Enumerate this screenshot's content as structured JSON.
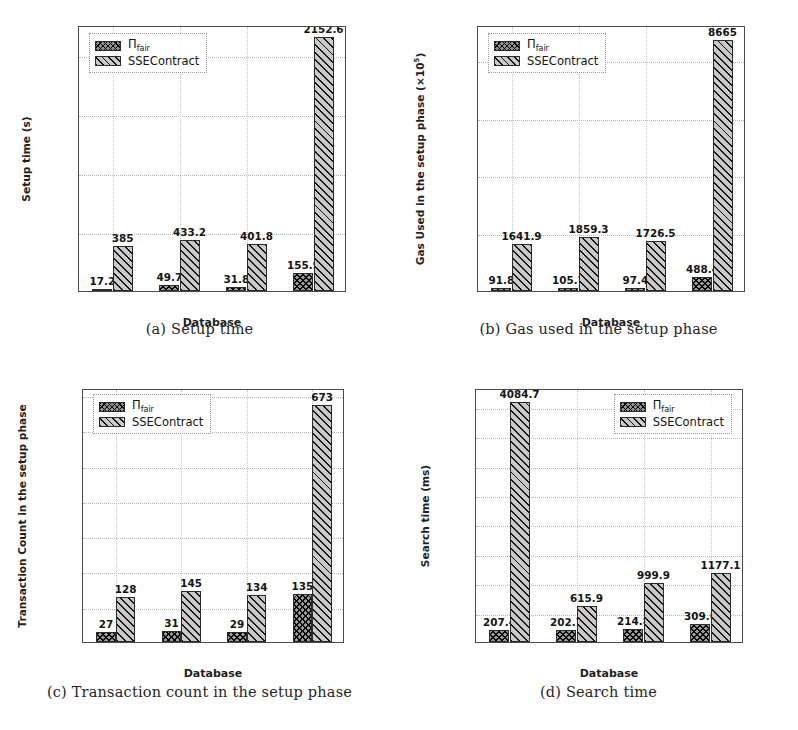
{
  "figure": {
    "series_labels": {
      "a": "Π",
      "a_sub": "fair",
      "b": "SSEContract"
    },
    "categories": [
      "DB",
      "DB",
      "DB",
      "DB"
    ],
    "category_subs": [
      "1",
      "2",
      "3",
      "4"
    ],
    "xlabel": "Database"
  },
  "panels": {
    "a": {
      "caption": "(a) Setup time",
      "ylabel": "Setup time (s)",
      "yticks": [
        "0",
        "500",
        "1000",
        "1500",
        "2000"
      ],
      "labels_a": [
        "17.2",
        "49.7",
        "31.8",
        "155.9"
      ],
      "labels_b": [
        "385",
        "433.2",
        "401.8",
        "2152.6"
      ]
    },
    "b": {
      "caption": "(b) Gas used in the setup phase",
      "ylabel": "Gas Used in the setup phase (×10",
      "ylabel_sup": "5",
      "ylabel_tail": ")",
      "yticks": [
        "0",
        "2000",
        "4000",
        "6000",
        "8000"
      ],
      "labels_a": [
        "91.8",
        "105.7",
        "97.4",
        "488.4"
      ],
      "labels_b": [
        "1641.9",
        "1859.3",
        "1726.5",
        "8665"
      ]
    },
    "c": {
      "caption": "(c) Transaction count in the setup phase",
      "ylabel": "Transaction Count in the setup phase",
      "yticks": [
        "0",
        "100",
        "200",
        "300",
        "400",
        "500",
        "600",
        "700"
      ],
      "labels_a": [
        "27",
        "31",
        "29",
        "135"
      ],
      "labels_b": [
        "128",
        "145",
        "134",
        "673"
      ]
    },
    "d": {
      "caption": "(d) Search time",
      "ylabel": "Search time (ms)",
      "yticks": [
        "0",
        "500",
        "1000",
        "1500",
        "2000",
        "2500",
        "3000",
        "3500",
        "4000"
      ],
      "labels_a": [
        "207.4",
        "202.7",
        "214.8",
        "309.6"
      ],
      "labels_b": [
        "4084.7",
        "615.9",
        "999.9",
        "1177.1"
      ]
    }
  },
  "chart_data": [
    {
      "id": "a",
      "type": "bar",
      "title": "(a) Setup time",
      "xlabel": "Database",
      "ylabel": "Setup time (s)",
      "categories": [
        "DB1",
        "DB2",
        "DB3",
        "DB4"
      ],
      "series": [
        {
          "name": "Π_fair",
          "values": [
            17.2,
            49.7,
            31.8,
            155.9
          ]
        },
        {
          "name": "SSEContract",
          "values": [
            385,
            433.2,
            401.8,
            2152.6
          ]
        }
      ],
      "yticks": [
        0,
        500,
        1000,
        1500,
        2000
      ],
      "ylim": [
        0,
        2250
      ],
      "grid": true,
      "legend_position": "upper-left"
    },
    {
      "id": "b",
      "type": "bar",
      "title": "(b) Gas used in the setup phase",
      "xlabel": "Database",
      "ylabel": "Gas Used in the setup phase (×10^5)",
      "categories": [
        "DB1",
        "DB2",
        "DB3",
        "DB4"
      ],
      "series": [
        {
          "name": "Π_fair",
          "values": [
            91.8,
            105.7,
            97.4,
            488.4
          ]
        },
        {
          "name": "SSEContract",
          "values": [
            1641.9,
            1859.3,
            1726.5,
            8665
          ]
        }
      ],
      "yticks": [
        0,
        2000,
        4000,
        6000,
        8000
      ],
      "ylim": [
        0,
        9200
      ],
      "grid": true,
      "legend_position": "upper-left"
    },
    {
      "id": "c",
      "type": "bar",
      "title": "(c) Transaction count in the setup phase",
      "xlabel": "Database",
      "ylabel": "Transaction Count in the setup phase",
      "categories": [
        "DB1",
        "DB2",
        "DB3",
        "DB4"
      ],
      "series": [
        {
          "name": "Π_fair",
          "values": [
            27,
            31,
            29,
            135
          ]
        },
        {
          "name": "SSEContract",
          "values": [
            128,
            145,
            134,
            673
          ]
        }
      ],
      "yticks": [
        0,
        100,
        200,
        300,
        400,
        500,
        600,
        700
      ],
      "ylim": [
        0,
        720
      ],
      "grid": true,
      "legend_position": "upper-left"
    },
    {
      "id": "d",
      "type": "bar",
      "title": "(d) Search time",
      "xlabel": "Database",
      "ylabel": "Search time (ms)",
      "categories": [
        "DB1",
        "DB2",
        "DB3",
        "DB4"
      ],
      "series": [
        {
          "name": "Π_fair",
          "values": [
            207.4,
            202.7,
            214.8,
            309.6
          ]
        },
        {
          "name": "SSEContract",
          "values": [
            4084.7,
            615.9,
            999.9,
            1177.1
          ]
        }
      ],
      "yticks": [
        0,
        500,
        1000,
        1500,
        2000,
        2500,
        3000,
        3500,
        4000
      ],
      "ylim": [
        0,
        4320
      ],
      "grid": true,
      "legend_position": "upper-right"
    }
  ]
}
